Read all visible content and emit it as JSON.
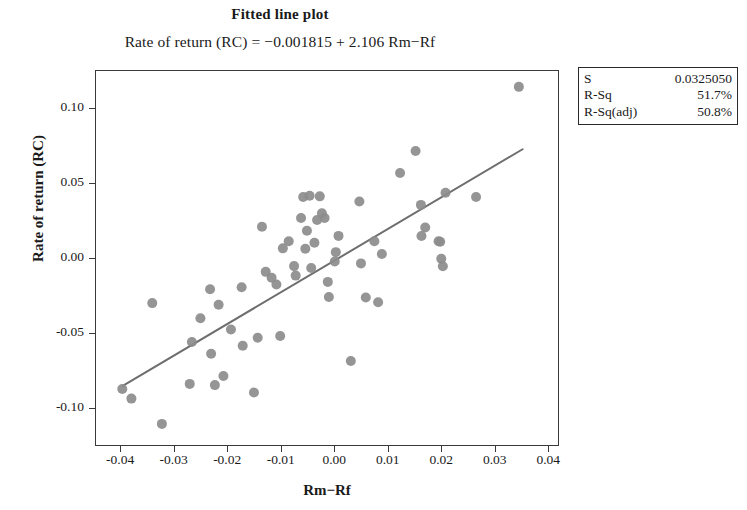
{
  "chart_data": {
    "type": "scatter",
    "title": "Fitted line plot",
    "subtitle": "Rate of return (RC) = −0.001815 + 2.106 Rm−Rf",
    "xlabel": "Rm−Rf",
    "ylabel": "Rate of return (RC)",
    "xlim": [
      -0.0447,
      0.042
    ],
    "ylim": [
      -0.125,
      0.125
    ],
    "xticks": [
      -0.04,
      -0.03,
      -0.02,
      -0.01,
      0.0,
      0.01,
      0.02,
      0.03,
      0.04
    ],
    "xticklabels": [
      "-0.04",
      "-0.03",
      "-0.02",
      "-0.01",
      "0.00",
      "0.01",
      "0.02",
      "0.03",
      "0.04"
    ],
    "yticks": [
      0.1,
      0.05,
      0.0,
      -0.05,
      -0.1
    ],
    "yticklabels": [
      "0.10",
      "0.05",
      "0.00",
      "-0.05",
      "-0.10"
    ],
    "grid": false,
    "legend": null,
    "marker_color": "#8c8c8c",
    "line_color": "#6e6e6e",
    "fit": {
      "intercept": -0.001815,
      "slope": 2.106,
      "x_start": -0.0396,
      "x_end": 0.0352,
      "label": "fitted regression line"
    },
    "series": [
      {
        "name": "Rate of return (RC) vs Rm-Rf",
        "points": [
          [
            -0.0396,
            -0.0871
          ],
          [
            -0.0379,
            -0.0935
          ],
          [
            -0.034,
            -0.03
          ],
          [
            -0.0322,
            -0.1103
          ],
          [
            -0.027,
            -0.0837
          ],
          [
            -0.0266,
            -0.0558
          ],
          [
            -0.025,
            -0.0401
          ],
          [
            -0.0232,
            -0.0208
          ],
          [
            -0.023,
            -0.0637
          ],
          [
            -0.0223,
            -0.0845
          ],
          [
            -0.0216,
            -0.0311
          ],
          [
            -0.0207,
            -0.0785
          ],
          [
            -0.0193,
            -0.0475
          ],
          [
            -0.0173,
            -0.0195
          ],
          [
            -0.0171,
            -0.0583
          ],
          [
            -0.015,
            -0.0894
          ],
          [
            -0.0143,
            -0.053
          ],
          [
            -0.0135,
            0.0208
          ],
          [
            -0.0128,
            -0.0092
          ],
          [
            -0.0117,
            -0.0131
          ],
          [
            -0.0108,
            -0.0176
          ],
          [
            -0.0101,
            -0.0519
          ],
          [
            -0.0096,
            0.0064
          ],
          [
            -0.0085,
            0.0111
          ],
          [
            -0.0075,
            -0.0054
          ],
          [
            -0.0072,
            -0.0117
          ],
          [
            -0.0062,
            0.0266
          ],
          [
            -0.0058,
            0.0406
          ],
          [
            -0.0054,
            0.0061
          ],
          [
            -0.0051,
            0.0181
          ],
          [
            -0.0046,
            0.0414
          ],
          [
            -0.0043,
            -0.0067
          ],
          [
            -0.0037,
            0.0101
          ],
          [
            -0.0032,
            0.0253
          ],
          [
            -0.0027,
            0.041
          ],
          [
            -0.0023,
            0.0297
          ],
          [
            -0.0018,
            0.0266
          ],
          [
            -0.0012,
            -0.0159
          ],
          [
            -0.001,
            -0.0259
          ],
          [
            0.0001,
            -0.0023
          ],
          [
            0.0003,
            0.0039
          ],
          [
            0.0008,
            0.0147
          ],
          [
            0.0031,
            -0.0685
          ],
          [
            0.0047,
            0.0376
          ],
          [
            0.005,
            -0.0036
          ],
          [
            0.0059,
            -0.0263
          ],
          [
            0.0075,
            0.0111
          ],
          [
            0.0082,
            -0.0294
          ],
          [
            0.0089,
            0.0027
          ],
          [
            0.0123,
            0.0565
          ],
          [
            0.0152,
            0.0712
          ],
          [
            0.0162,
            0.0353
          ],
          [
            0.0163,
            0.0146
          ],
          [
            0.017,
            0.0203
          ],
          [
            0.0195,
            0.0111
          ],
          [
            0.0198,
            0.0108
          ],
          [
            0.02,
            -0.0005
          ],
          [
            0.0203,
            -0.0055
          ],
          [
            0.0208,
            0.0434
          ],
          [
            0.0265,
            0.0406
          ],
          [
            0.0345,
            0.1138
          ]
        ]
      }
    ],
    "stats": {
      "rows": [
        {
          "key": "S",
          "value": "0.0325050"
        },
        {
          "key": "R-Sq",
          "value": "51.7%"
        },
        {
          "key": "R-Sq(adj)",
          "value": "50.8%"
        }
      ]
    }
  }
}
